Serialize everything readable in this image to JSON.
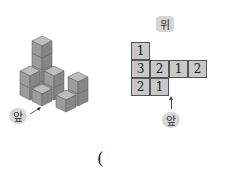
{
  "labels": {
    "top_view": "위",
    "front_left": "앞",
    "front_right": "앞",
    "answer_paren": "("
  },
  "top_view_grid": {
    "rows": [
      [
        1,
        null,
        null,
        null
      ],
      [
        3,
        2,
        1,
        2
      ],
      [
        2,
        1,
        null,
        null
      ]
    ]
  },
  "cells": [
    {
      "row": 0,
      "col": 0,
      "value": "1"
    },
    {
      "row": 1,
      "col": 0,
      "value": "3"
    },
    {
      "row": 1,
      "col": 1,
      "value": "2"
    },
    {
      "row": 1,
      "col": 2,
      "value": "1"
    },
    {
      "row": 1,
      "col": 3,
      "value": "2"
    },
    {
      "row": 2,
      "col": 0,
      "value": "2"
    },
    {
      "row": 2,
      "col": 1,
      "value": "1"
    }
  ],
  "colors": {
    "cube_top": "#bdbdbd",
    "cube_left": "#9a9a9a",
    "cube_right": "#858585",
    "cell_fill": "#c8c8c8",
    "badge": "#d6d6d6"
  }
}
